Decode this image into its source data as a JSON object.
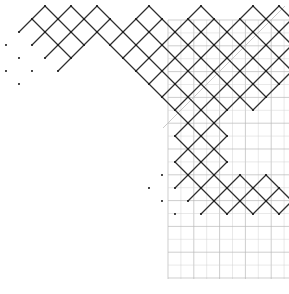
{
  "figure": {
    "background_color": "#ffffff",
    "width": 289,
    "height": 294,
    "lattice_line_color": "#2e2e2e",
    "grid_line_color": "#b9b9b9",
    "grid_minor_color": "#d2d2d2",
    "diagonal_boundary_color": "#c4c4c4",
    "vertex_dot_color": "#1b1b1b"
  },
  "chart_data": {
    "type": "diagram",
    "xlabel": "",
    "ylabel": "",
    "grid": {
      "visible": true,
      "x_start": 168,
      "x_end": 289,
      "y_start": 20,
      "y_end": 279,
      "cell_size": 12.9,
      "x_lines": [
        168.0,
        180.9,
        193.8,
        206.7,
        219.6,
        232.5,
        245.4,
        258.3,
        271.2,
        284.1
      ],
      "y_lines": [
        20.0,
        32.9,
        45.8,
        58.7,
        71.6,
        84.5,
        97.4,
        110.3,
        123.2,
        136.1,
        149.0,
        161.9,
        174.8,
        187.7,
        200.6,
        213.5,
        226.4,
        239.3,
        252.2,
        265.1,
        278.0
      ]
    },
    "diagonal_boundary": {
      "description": "light grey anti-diagonal line from upper right to lower left",
      "x1": 285,
      "y1": 6,
      "x2": 163,
      "y2": 128
    },
    "lattice": {
      "description": "Rotated-square (diamond) tiles on a 45-degree lattice; half-diagonal 13 px",
      "half_diagonal": 13,
      "unit": 13,
      "origin_x": 19,
      "origin_y": 19,
      "diamond_centers": [
        [
          2,
          0
        ],
        [
          4,
          0
        ],
        [
          6,
          0
        ],
        [
          10,
          0
        ],
        [
          14,
          0
        ],
        [
          18,
          0
        ],
        [
          20,
          0
        ],
        [
          1,
          1
        ],
        [
          3,
          1
        ],
        [
          5,
          1
        ],
        [
          7,
          1
        ],
        [
          9,
          1
        ],
        [
          11,
          1
        ],
        [
          13,
          1
        ],
        [
          15,
          1
        ],
        [
          17,
          1
        ],
        [
          19,
          1
        ],
        [
          0,
          2
        ],
        [
          2,
          2
        ],
        [
          4,
          2
        ],
        [
          8,
          2
        ],
        [
          10,
          2
        ],
        [
          12,
          2
        ],
        [
          14,
          2
        ],
        [
          16,
          2
        ],
        [
          18,
          2
        ],
        [
          20,
          2
        ],
        [
          1,
          3
        ],
        [
          3,
          3
        ],
        [
          9,
          3
        ],
        [
          11,
          3
        ],
        [
          13,
          3
        ],
        [
          15,
          3
        ],
        [
          17,
          3
        ],
        [
          19,
          3
        ],
        [
          0,
          4
        ],
        [
          10,
          4
        ],
        [
          12,
          4
        ],
        [
          14,
          4
        ],
        [
          16,
          4
        ],
        [
          18,
          4
        ],
        [
          20,
          4
        ],
        [
          11,
          5
        ],
        [
          13,
          5
        ],
        [
          15,
          5
        ],
        [
          17,
          5
        ],
        [
          19,
          5
        ],
        [
          12,
          6
        ],
        [
          14,
          6
        ],
        [
          16,
          6
        ],
        [
          18,
          6
        ],
        [
          13,
          7
        ],
        [
          15,
          7
        ],
        [
          14,
          8
        ],
        [
          13,
          9
        ],
        [
          15,
          9
        ],
        [
          14,
          10
        ],
        [
          13,
          11
        ],
        [
          15,
          11
        ],
        [
          14,
          12
        ],
        [
          11,
          13
        ],
        [
          13,
          13
        ],
        [
          15,
          13
        ],
        [
          17,
          13
        ],
        [
          19,
          13
        ],
        [
          12,
          14
        ],
        [
          14,
          14
        ],
        [
          16,
          14
        ],
        [
          18,
          14
        ],
        [
          20,
          14
        ]
      ]
    },
    "legend": {
      "visible": false
    },
    "annotations": []
  }
}
